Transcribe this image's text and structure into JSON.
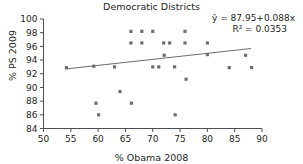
{
  "chart_data": {
    "type": "scatter",
    "title": "Democratic Districts",
    "xlabel": "% Obama 2008",
    "ylabel": "% PS 2009",
    "xlim": [
      50,
      90
    ],
    "ylim": [
      84,
      100
    ],
    "xticks": [
      50,
      55,
      60,
      65,
      70,
      75,
      80,
      85,
      90
    ],
    "yticks": [
      84,
      86,
      88,
      90,
      92,
      94,
      96,
      98,
      100
    ],
    "grid": false,
    "legend": null,
    "annotations": {
      "equation": "ŷ = 87.95+0.088x",
      "r_squared": "R² = 0.0353"
    },
    "fit": {
      "type": "linear",
      "intercept": 87.95,
      "slope": 0.088,
      "x_start": 54,
      "x_end": 88
    },
    "points": [
      {
        "x": 54.2,
        "y": 92.9
      },
      {
        "x": 59.2,
        "y": 93.1
      },
      {
        "x": 59.6,
        "y": 87.7
      },
      {
        "x": 60.1,
        "y": 86.0
      },
      {
        "x": 63.0,
        "y": 93.0
      },
      {
        "x": 64.0,
        "y": 89.4
      },
      {
        "x": 66.0,
        "y": 98.2
      },
      {
        "x": 66.0,
        "y": 96.5
      },
      {
        "x": 66.1,
        "y": 87.7
      },
      {
        "x": 68.0,
        "y": 98.2
      },
      {
        "x": 68.0,
        "y": 96.5
      },
      {
        "x": 70.0,
        "y": 98.2
      },
      {
        "x": 70.0,
        "y": 93.0
      },
      {
        "x": 71.1,
        "y": 93.0
      },
      {
        "x": 72.0,
        "y": 96.5
      },
      {
        "x": 72.1,
        "y": 94.7
      },
      {
        "x": 73.1,
        "y": 96.5
      },
      {
        "x": 74.0,
        "y": 93.0
      },
      {
        "x": 74.1,
        "y": 86.0
      },
      {
        "x": 75.9,
        "y": 98.2
      },
      {
        "x": 75.9,
        "y": 96.5
      },
      {
        "x": 76.1,
        "y": 91.2
      },
      {
        "x": 80.0,
        "y": 96.5
      },
      {
        "x": 80.0,
        "y": 94.8
      },
      {
        "x": 84.0,
        "y": 92.9
      },
      {
        "x": 87.0,
        "y": 94.7
      },
      {
        "x": 88.1,
        "y": 92.9
      }
    ]
  }
}
